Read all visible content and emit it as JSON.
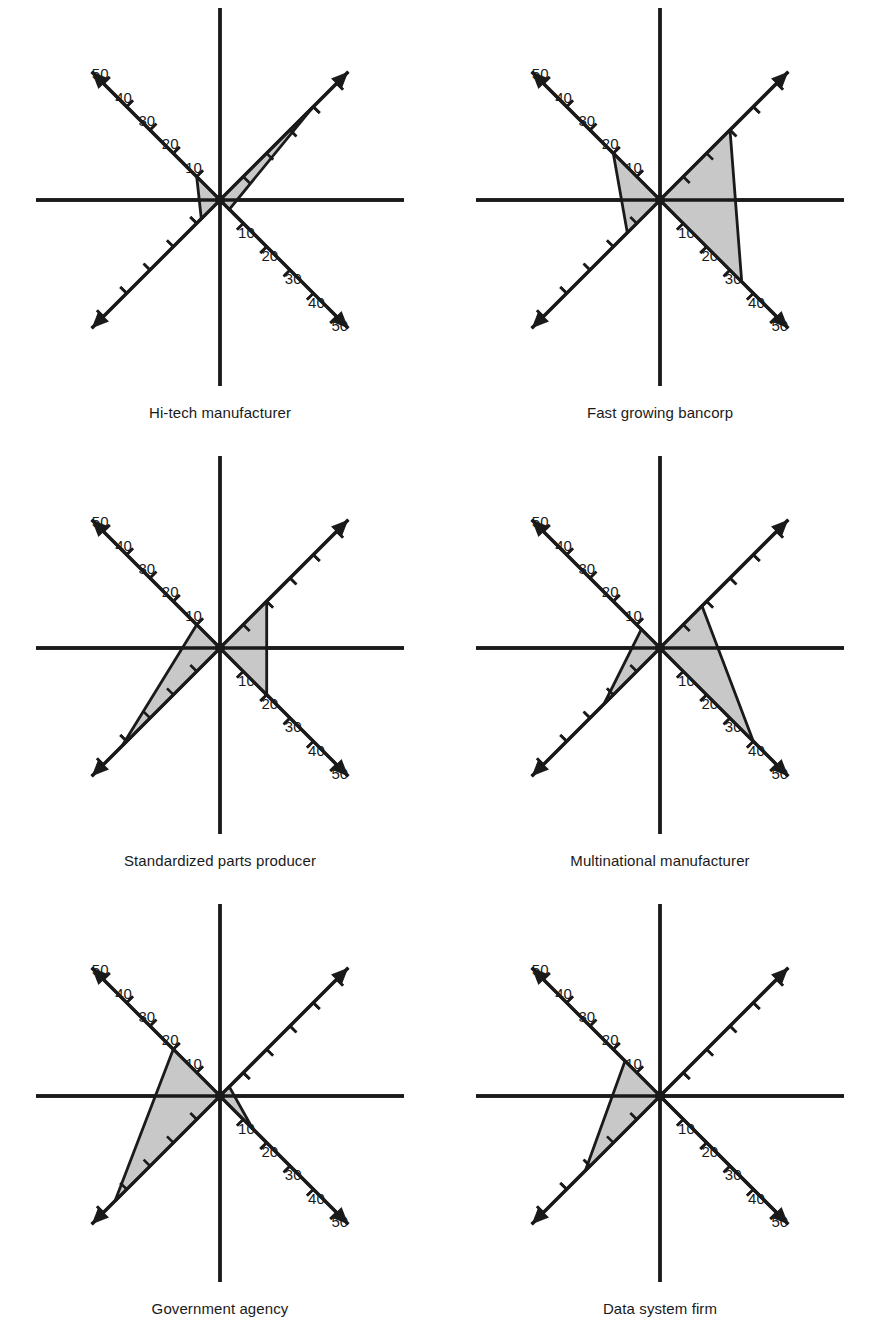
{
  "figure": {
    "type": "radar-star-chart-grid",
    "columns": 2,
    "rows": 3,
    "axis_max": 50,
    "axis_min": 0,
    "tick_step": 10,
    "tick_values": [
      10,
      20,
      30,
      40,
      50
    ],
    "labeled_axes": [
      "northwest",
      "southeast"
    ],
    "axis_directions": [
      "north",
      "northeast",
      "southeast",
      "south",
      "southwest",
      "northwest"
    ],
    "colors": {
      "fill": "#c8c8c8",
      "stroke": "#1a1a1a",
      "background": "#ffffff",
      "text": "#1a1a1a"
    }
  },
  "chart_data": [
    {
      "type": "radar",
      "title": "Hi-tech manufacturer",
      "categories": [
        "north",
        "northeast",
        "southeast",
        "south",
        "southwest",
        "northwest"
      ],
      "values": [
        0,
        40,
        4,
        0,
        8,
        10
      ],
      "axis_max": 50,
      "tick_labels": [
        "10",
        "20",
        "30",
        "40",
        "50"
      ],
      "grid": false,
      "legend": "none"
    },
    {
      "type": "radar",
      "title": "Fast growing bancorp",
      "categories": [
        "north",
        "northeast",
        "southeast",
        "south",
        "southwest",
        "northwest"
      ],
      "values": [
        0,
        30,
        35,
        0,
        14,
        20
      ],
      "axis_max": 50,
      "tick_labels": [
        "10",
        "20",
        "30",
        "40",
        "50"
      ],
      "grid": false,
      "legend": "none"
    },
    {
      "type": "radar",
      "title": "Standardized parts producer",
      "categories": [
        "north",
        "northeast",
        "southeast",
        "south",
        "southwest",
        "northwest"
      ],
      "values": [
        0,
        20,
        20,
        0,
        42,
        10
      ],
      "axis_max": 50,
      "tick_labels": [
        "10",
        "20",
        "30",
        "40",
        "50"
      ],
      "grid": false,
      "legend": "none"
    },
    {
      "type": "radar",
      "title": "Multinational manufacturer",
      "categories": [
        "north",
        "northeast",
        "southeast",
        "south",
        "southwest",
        "northwest"
      ],
      "values": [
        0,
        18,
        40,
        0,
        24,
        8
      ],
      "axis_max": 50,
      "tick_labels": [
        "10",
        "20",
        "30",
        "40",
        "50"
      ],
      "grid": false,
      "legend": "none"
    },
    {
      "type": "radar",
      "title": "Government agency",
      "categories": [
        "north",
        "northeast",
        "southeast",
        "south",
        "southwest",
        "northwest"
      ],
      "values": [
        0,
        4,
        14,
        0,
        45,
        20
      ],
      "axis_max": 50,
      "tick_labels": [
        "10",
        "20",
        "30",
        "40",
        "50"
      ],
      "grid": false,
      "legend": "none"
    },
    {
      "type": "radar",
      "title": "Data system firm",
      "categories": [
        "north",
        "northeast",
        "southeast",
        "south",
        "southwest",
        "northwest"
      ],
      "values": [
        0,
        0,
        50,
        0,
        32,
        15
      ],
      "axis_max": 50,
      "tick_labels": [
        "10",
        "20",
        "30",
        "40",
        "50"
      ],
      "grid": false,
      "legend": "none"
    }
  ]
}
